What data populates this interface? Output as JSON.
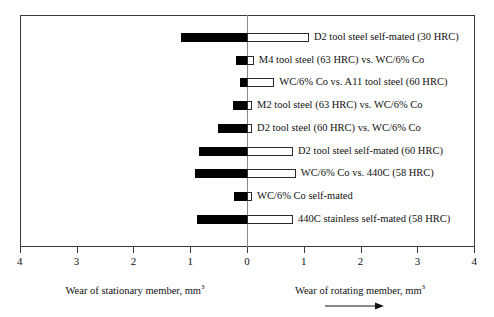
{
  "chart_data": {
    "type": "bar",
    "orientation": "horizontal-diverging",
    "title": "",
    "xlabel_left": "Wear of stationary member, mm3",
    "xlabel_right": "Wear of rotating member, mm3",
    "xlabel_left_display": "Wear of stationary member, mm",
    "xlabel_left_sup": "3",
    "xlabel_right_display": "Wear of rotating member, mm",
    "xlabel_right_sup": "3",
    "ylabel": "",
    "xlim": [
      -4,
      4
    ],
    "grid": false,
    "legend": "none",
    "tick_labels": [
      "4",
      "3",
      "2",
      "1",
      "0",
      "1",
      "2",
      "3",
      "4"
    ],
    "tick_values": [
      -4,
      -3,
      -2,
      -1,
      0,
      1,
      2,
      3,
      4
    ],
    "arrow_annotation": "increasing wear of rotating member",
    "categories": [
      "D2 tool steel self-mated (30 HRC)",
      "M4 tool steel (63 HRC) vs. WC/6% Co",
      "WC/6% Co vs. A11 tool steel (60 HRC)",
      "M2 tool steel (63 HRC) vs. WC/6% Co",
      "D2 tool steel (60 HRC) vs. WC/6% Co",
      "D2 tool steel self-mated (60 HRC)",
      "WC/6% Co vs. 440C (58 HRC)",
      "WC/6% Co self-mated",
      "440C stainless self-mated (58 HRC)"
    ],
    "series": [
      {
        "name": "Wear of stationary member, mm3",
        "direction": "left",
        "color": "#000000",
        "values": [
          1.16,
          0.19,
          0.12,
          0.25,
          0.51,
          0.85,
          0.92,
          0.23,
          0.88
        ]
      },
      {
        "name": "Wear of rotating member, mm3",
        "direction": "right",
        "color": "#ffffff",
        "values": [
          1.09,
          0.12,
          0.48,
          0.09,
          0.09,
          0.81,
          0.86,
          0.09,
          0.81
        ]
      }
    ]
  }
}
